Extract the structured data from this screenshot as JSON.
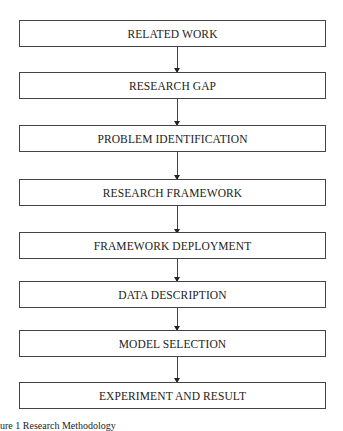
{
  "diagram": {
    "type": "flowchart",
    "direction": "top-to-bottom",
    "steps": [
      {
        "label": "RELATED WORK"
      },
      {
        "label": "RESEARCH GAP"
      },
      {
        "label": "PROBLEM IDENTIFICATION"
      },
      {
        "label": "RESEARCH FRAMEWORK"
      },
      {
        "label": "FRAMEWORK DEPLOYMENT"
      },
      {
        "label": "DATA DESCRIPTION"
      },
      {
        "label": "MODEL SELECTION"
      },
      {
        "label": "EXPERIMENT AND RESULT"
      }
    ],
    "caption": "ure 1 Research Methodology"
  }
}
